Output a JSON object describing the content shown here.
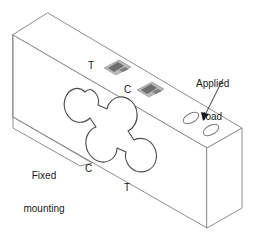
{
  "figure": {
    "kind": "isometric-engineering-diagram",
    "background_color": "#ffffff",
    "line_color": "#808080",
    "outline_color": "#3a3a3a",
    "text_color": "#1a1a1a",
    "gauge_color": "#9a9a9a",
    "gauge_dark_color": "#6e6e6e"
  },
  "labels": {
    "applied_load": {
      "line1": "Applied",
      "line2": "load",
      "x": 200,
      "y": 62
    },
    "fixed_mounting": {
      "line1": "Fixed",
      "line2": "mounting",
      "line3": "point",
      "x": 10,
      "y": 150
    },
    "tension_top": {
      "text": "T",
      "x": 89,
      "y": 61
    },
    "compression_top": {
      "text": "C",
      "x": 124,
      "y": 85
    },
    "compression_bottom": {
      "text": "C",
      "x": 86,
      "y": 164
    },
    "tension_bottom": {
      "text": "T",
      "x": 125,
      "y": 183
    }
  },
  "annotations": {
    "strain_gauge_tension": "strain-gauge-tension",
    "strain_gauge_compression": "strain-gauge-compression",
    "mounting_hole_upper": "mounting-hole-upper",
    "mounting_hole_lower": "mounting-hole-lower",
    "cutout": "quatrefoil-shear-cutout",
    "leader_arrow": "applied-load-leader-arrow"
  }
}
